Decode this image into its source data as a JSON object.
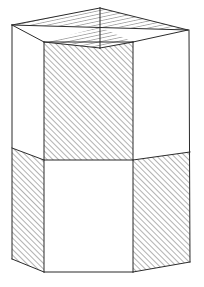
{
  "figure": {
    "background_color": "#ffffff",
    "stroke_color": "#2b2b2b",
    "hatch_color": "#555555",
    "fill_color": "#ffffff",
    "stroke_width": 1,
    "hatch_spacing": 4,
    "hatch_angle_degrees": 45,
    "canvas": {
      "width": 204,
      "height": 287
    }
  },
  "geometry": {
    "top_face": {
      "name": "top-rhombus",
      "vertices": [
        {
          "id": "L",
          "x": 12,
          "y": 25
        },
        {
          "id": "B",
          "x": 100,
          "y": 8
        },
        {
          "id": "R",
          "x": 188,
          "y": 30
        },
        {
          "id": "FR",
          "x": 133,
          "y": 42
        },
        {
          "id": "F",
          "x": 100,
          "y": 48
        },
        {
          "id": "FL",
          "x": 44,
          "y": 42
        }
      ],
      "center": {
        "x": 100,
        "y": 27
      },
      "sectors": [
        {
          "name": "rear-left-triangle",
          "points": "12,25 100,8 100,27",
          "hatched": true
        },
        {
          "name": "rear-right-triangle",
          "points": "100,8 188,30 100,27",
          "hatched": true
        },
        {
          "name": "left-triangle",
          "points": "12,25 100,27 44,42",
          "hatched": false
        },
        {
          "name": "right-triangle",
          "points": "188,30 100,27 133,42",
          "hatched": false
        },
        {
          "name": "front-left-triangle",
          "points": "44,42 100,27 100,48",
          "hatched": true
        },
        {
          "name": "front-right-triangle",
          "points": "100,27 133,42 100,48",
          "hatched": true
        }
      ]
    },
    "side_faces": [
      {
        "name": "left-face-upper",
        "points": "12,25 44,42 44,160 12,148",
        "hatched": false
      },
      {
        "name": "front-face-upper",
        "points": "44,42 133,42 133,160 44,160",
        "hatched": true
      },
      {
        "name": "right-face-upper",
        "points": "133,42 188,30 190,152 133,160",
        "hatched": false
      },
      {
        "name": "left-face-lower",
        "points": "12,148 44,160 44,272 12,259",
        "hatched": true
      },
      {
        "name": "front-face-lower",
        "points": "44,160 133,160 133,272 44,272",
        "hatched": false
      },
      {
        "name": "right-face-lower",
        "points": "133,160 190,152 190,262 133,272",
        "hatched": true
      }
    ],
    "edges": [
      {
        "name": "edge-top-left-back",
        "x1": 12,
        "y1": 25,
        "x2": 100,
        "y2": 8
      },
      {
        "name": "edge-top-right-back",
        "x1": 100,
        "y1": 8,
        "x2": 188,
        "y2": 30
      },
      {
        "name": "edge-top-left-front",
        "x1": 12,
        "y1": 25,
        "x2": 44,
        "y2": 42
      },
      {
        "name": "edge-top-front",
        "x1": 44,
        "y1": 42,
        "x2": 133,
        "y2": 42
      },
      {
        "name": "edge-top-right-front",
        "x1": 133,
        "y1": 42,
        "x2": 188,
        "y2": 30
      },
      {
        "name": "diagonal-top-left-right",
        "x1": 12,
        "y1": 25,
        "x2": 188,
        "y2": 30
      },
      {
        "name": "diagonal-top-back-front",
        "x1": 100,
        "y1": 8,
        "x2": 100,
        "y2": 48
      },
      {
        "name": "diagonal-front-left",
        "x1": 44,
        "y1": 42,
        "x2": 100,
        "y2": 48
      },
      {
        "name": "diagonal-front-right",
        "x1": 100,
        "y1": 48,
        "x2": 133,
        "y2": 42
      },
      {
        "name": "vertical-far-left",
        "x1": 12,
        "y1": 25,
        "x2": 12,
        "y2": 259
      },
      {
        "name": "vertical-front-left",
        "x1": 44,
        "y1": 42,
        "x2": 44,
        "y2": 272
      },
      {
        "name": "vertical-front-right",
        "x1": 133,
        "y1": 42,
        "x2": 133,
        "y2": 272
      },
      {
        "name": "vertical-far-right",
        "x1": 189,
        "y1": 30,
        "x2": 190,
        "y2": 262
      },
      {
        "name": "mid-band-left",
        "x1": 12,
        "y1": 148,
        "x2": 44,
        "y2": 160
      },
      {
        "name": "mid-band-front",
        "x1": 44,
        "y1": 160,
        "x2": 133,
        "y2": 160
      },
      {
        "name": "mid-band-right",
        "x1": 133,
        "y1": 160,
        "x2": 190,
        "y2": 152
      },
      {
        "name": "bottom-left",
        "x1": 12,
        "y1": 259,
        "x2": 44,
        "y2": 272
      },
      {
        "name": "bottom-front",
        "x1": 44,
        "y1": 272,
        "x2": 133,
        "y2": 272
      },
      {
        "name": "bottom-right",
        "x1": 133,
        "y1": 272,
        "x2": 190,
        "y2": 262
      }
    ]
  }
}
